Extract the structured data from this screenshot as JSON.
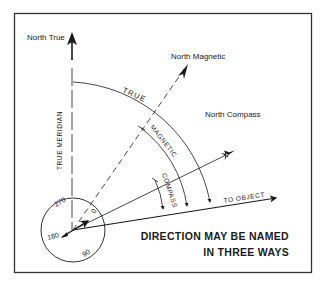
{
  "diagram": {
    "title_line1": "DIRECTION MAY BE NAMED",
    "title_line2": "IN THREE WAYS",
    "labels": {
      "north_true": "North True",
      "north_magnetic": "North Magnetic",
      "north_compass": "North Compass",
      "true_meridian": "TRUE MERIDIAN",
      "to_object": "TO OBJECT"
    },
    "arcs": {
      "true": "TRUE",
      "magnetic": "MAGNETIC",
      "compass": "COMPASS"
    },
    "compass_card": {
      "marks": [
        "0",
        "90",
        "180",
        "270"
      ]
    },
    "colors": {
      "ink": "#1a1a1a",
      "frame": "#333333",
      "background": "#ffffff"
    }
  }
}
